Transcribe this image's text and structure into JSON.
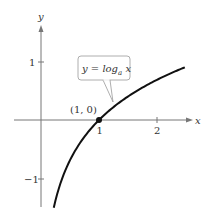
{
  "chart_data": {
    "type": "line",
    "title": "",
    "xlabel": "x",
    "ylabel": "y",
    "xlim": [
      -0.5,
      2.6
    ],
    "ylim": [
      -1.5,
      1.6
    ],
    "x_ticks": [
      {
        "value": 1,
        "label": "1"
      },
      {
        "value": 2,
        "label": "2"
      }
    ],
    "y_ticks": [
      {
        "value": 1,
        "label": "1"
      },
      {
        "value": -1,
        "label": "−1"
      }
    ],
    "grid": false,
    "series": [
      {
        "name": "y = log_a x",
        "function": "log_a(x)",
        "x": [
          0.22,
          0.3,
          0.4,
          0.5,
          0.6,
          0.8,
          1.0,
          1.25,
          1.5,
          1.75,
          2.0,
          2.25,
          2.48
        ],
        "values": [
          -1.51,
          -1.2,
          -0.92,
          -0.69,
          -0.51,
          -0.22,
          0,
          0.22,
          0.41,
          0.56,
          0.69,
          0.81,
          0.91
        ],
        "color": "#000000"
      }
    ],
    "annotations": [
      {
        "type": "point",
        "x": 1,
        "y": 0,
        "label": "(1, 0)"
      },
      {
        "type": "callout",
        "text_prefix": "y = log",
        "subscript": "a",
        "text_suffix": " x"
      }
    ]
  },
  "labels": {
    "x_axis": "x",
    "y_axis": "y",
    "tick_x1": "1",
    "tick_x2": "2",
    "tick_y1": "1",
    "tick_ym1": "−1",
    "point": "(1, 0)",
    "callout_prefix": "y = log",
    "callout_sub": "a",
    "callout_suffix": " x"
  }
}
